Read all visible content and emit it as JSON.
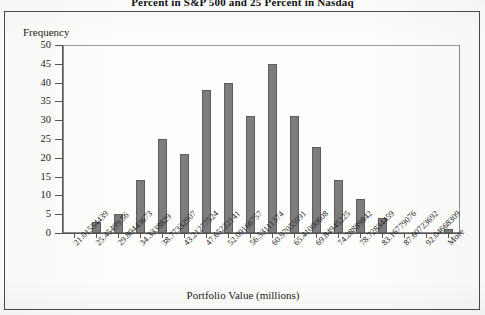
{
  "document": {
    "title": "Percent in S&P 500 and 25 Percent in Nasdaq"
  },
  "chart_data": {
    "type": "bar",
    "title": "Percent in S&P 500 and 25 Percent in Nasdaq",
    "xlabel": "Portfolio Value (millions)",
    "ylabel": "Frequency",
    "ylim": [
      0,
      50
    ],
    "ytick_step": 5,
    "grid": false,
    "legend": false,
    "bar_color": "#7d7d7d",
    "bar_edge_color": "#5d5d5d",
    "categories": [
      "21.01554439",
      "25.45499.56",
      "29.89443673",
      "34.3338829",
      "38.77332907",
      "43.21277524",
      "47.65222141",
      "52.09166757",
      "56.53111374",
      "60.97055991",
      "65.41000608",
      "69.84945225",
      "74.28889842",
      "78.72834459",
      "83.16779076",
      "87.60723692",
      "92.04668309",
      "More"
    ],
    "values": [
      0,
      3,
      5,
      14,
      25,
      21,
      38,
      40,
      31,
      45,
      31,
      23,
      14,
      9,
      4,
      0,
      0,
      1
    ],
    "yticks": [
      "0",
      "5",
      "10",
      "15",
      "20",
      "25",
      "30",
      "35",
      "40",
      "45",
      "50"
    ]
  }
}
